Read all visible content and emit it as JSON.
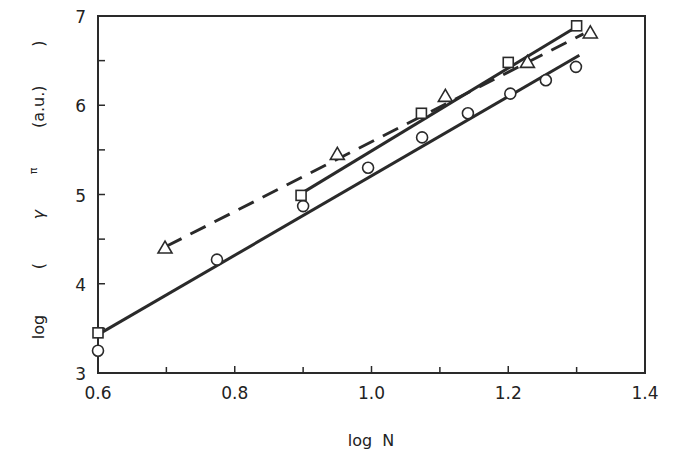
{
  "chart_data": {
    "type": "scatter",
    "title": "",
    "xlabel": "log  N",
    "ylabel": "log  ( γ^π (a.u.) )",
    "ylabel_parts": {
      "prefix": "log",
      "open": "(",
      "symbol": "γ",
      "superscript": "π",
      "unit": "(a.u.)",
      "close": ")"
    },
    "xlim": [
      0.6,
      1.4
    ],
    "ylim": [
      3,
      7
    ],
    "x_ticks": [
      0.6,
      0.8,
      1.0,
      1.2,
      1.4
    ],
    "x_tick_labels": [
      "0.6",
      "0.8",
      "1.0",
      "1.2",
      "1.4"
    ],
    "x_minor_ticks": [
      0.7,
      0.9,
      1.1,
      1.3
    ],
    "y_ticks": [
      3,
      4,
      5,
      6,
      7
    ],
    "y_tick_labels": [
      "3",
      "4",
      "5",
      "6",
      "7"
    ],
    "y_minor_ticks": [
      3.5,
      4.5,
      5.5,
      6.5
    ],
    "grid": false,
    "legend": null,
    "series": [
      {
        "name": "circles",
        "marker": "circle",
        "points": [
          [
            0.6,
            3.25
          ],
          [
            0.774,
            4.27
          ],
          [
            0.9,
            4.87
          ],
          [
            0.995,
            5.3
          ],
          [
            1.074,
            5.64
          ],
          [
            1.141,
            5.91
          ],
          [
            1.203,
            6.13
          ],
          [
            1.255,
            6.28
          ],
          [
            1.299,
            6.43
          ]
        ],
        "fit_line": {
          "style": "solid",
          "from": [
            0.6,
            3.43
          ],
          "to": [
            1.304,
            6.56
          ]
        }
      },
      {
        "name": "squares",
        "marker": "square",
        "points": [
          [
            0.6,
            3.45
          ],
          [
            0.897,
            4.99
          ],
          [
            1.073,
            5.91
          ],
          [
            1.2,
            6.48
          ],
          [
            1.3,
            6.89
          ]
        ],
        "fit_line": {
          "style": "solid",
          "from": [
            0.897,
            5.01
          ],
          "to": [
            1.3,
            6.88
          ]
        }
      },
      {
        "name": "triangles",
        "marker": "triangle",
        "points": [
          [
            0.698,
            4.4
          ],
          [
            0.95,
            5.45
          ],
          [
            1.108,
            6.1
          ],
          [
            1.228,
            6.48
          ],
          [
            1.32,
            6.81
          ]
        ],
        "fit_line": {
          "style": "dashed",
          "from": [
            0.7,
            4.42
          ],
          "to": [
            1.31,
            6.8
          ]
        }
      }
    ]
  }
}
